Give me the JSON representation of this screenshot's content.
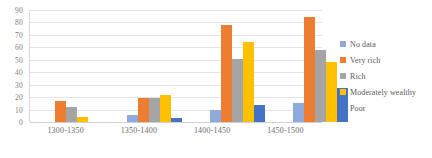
{
  "chart_data": {
    "type": "bar",
    "title": "",
    "subtitle": "",
    "xlabel": "",
    "ylabel": "",
    "ylim": [
      0,
      90
    ],
    "ytick_step": 10,
    "yticks": [
      "0",
      "10",
      "20",
      "30",
      "40",
      "50",
      "60",
      "70",
      "80",
      "90"
    ],
    "grid": "horizontal",
    "legend_position": "right",
    "categories": [
      "1300-1350",
      "1350-1400",
      "1400-1450",
      "1450-1500"
    ],
    "series": [
      {
        "name": "No data",
        "color": "#8FAADC",
        "values": [
          0,
          6,
          10,
          15
        ]
      },
      {
        "name": "Very rich",
        "color": "#ED7D31",
        "values": [
          17,
          19,
          78,
          84
        ]
      },
      {
        "name": "Rich",
        "color": "#A5A5A5",
        "values": [
          12,
          19,
          51,
          58
        ]
      },
      {
        "name": "Moderately wealthy",
        "color": "#FFC000",
        "values": [
          4,
          22,
          64,
          48
        ]
      },
      {
        "name": "Poor",
        "color": "#4472C4",
        "values": [
          0,
          3,
          14,
          27
        ]
      }
    ]
  }
}
